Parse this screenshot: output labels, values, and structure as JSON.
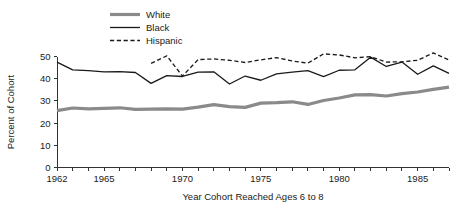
{
  "chart_data": {
    "type": "line",
    "title": "",
    "xlabel": "Year Cohort Reached Ages 6 to 8",
    "ylabel": "Percent of Cohort",
    "xlim": [
      1962,
      1987
    ],
    "ylim": [
      0,
      50
    ],
    "grid": false,
    "legend_position": "top-left",
    "x_tick_labels": [
      "1962",
      "1965",
      "1970",
      "1975",
      "1980",
      "1985"
    ],
    "x_tick_values": [
      1962,
      1965,
      1970,
      1975,
      1980,
      1985
    ],
    "x_minor_ticks": [
      1962,
      1963,
      1964,
      1965,
      1966,
      1967,
      1968,
      1969,
      1970,
      1971,
      1972,
      1973,
      1974,
      1975,
      1976,
      1977,
      1978,
      1979,
      1980,
      1981,
      1982,
      1983,
      1984,
      1985,
      1986,
      1987
    ],
    "y_tick_labels": [
      "0",
      "10",
      "20",
      "30",
      "40",
      "50"
    ],
    "y_tick_values": [
      0,
      10,
      20,
      30,
      40,
      50
    ],
    "x": [
      1962,
      1963,
      1964,
      1965,
      1966,
      1967,
      1968,
      1969,
      1970,
      1971,
      1972,
      1973,
      1974,
      1975,
      1976,
      1977,
      1978,
      1979,
      1980,
      1981,
      1982,
      1983,
      1984,
      1985,
      1986,
      1987
    ],
    "series": [
      {
        "name": "White",
        "style": "solid-thick",
        "color": "#8a8a8a",
        "width": 3.2,
        "x": [
          1962,
          1963,
          1964,
          1965,
          1966,
          1967,
          1968,
          1969,
          1970,
          1971,
          1972,
          1973,
          1974,
          1975,
          1976,
          1977,
          1978,
          1979,
          1980,
          1981,
          1982,
          1983,
          1984,
          1985,
          1986,
          1987
        ],
        "values": [
          25.6,
          26.8,
          26.4,
          26.6,
          26.9,
          26.2,
          26.3,
          26.4,
          26.3,
          27.2,
          28.3,
          27.4,
          27.1,
          29.0,
          29.2,
          29.6,
          28.4,
          30.2,
          31.3,
          32.7,
          32.8,
          32.2,
          33.3,
          34.0,
          35.2,
          36.2
        ]
      },
      {
        "name": "Black",
        "style": "solid-thin",
        "color": "#1a1a1a",
        "width": 1.3,
        "x": [
          1962,
          1963,
          1964,
          1965,
          1966,
          1967,
          1968,
          1969,
          1970,
          1971,
          1972,
          1973,
          1974,
          1975,
          1976,
          1977,
          1978,
          1979,
          1980,
          1981,
          1982,
          1983,
          1984,
          1985,
          1986,
          1987
        ],
        "values": [
          47.5,
          44.0,
          43.6,
          43.1,
          43.2,
          42.8,
          37.9,
          41.4,
          41.0,
          43.0,
          43.1,
          37.6,
          41.2,
          39.3,
          42.2,
          43.0,
          43.6,
          40.9,
          43.8,
          44.0,
          49.7,
          45.5,
          47.5,
          42.0,
          45.8,
          42.4
        ]
      },
      {
        "name": "Hispanic",
        "style": "dashed",
        "color": "#1a1a1a",
        "width": 1.3,
        "x": [
          1968,
          1969,
          1970,
          1971,
          1972,
          1973,
          1974,
          1975,
          1976,
          1977,
          1978,
          1979,
          1980,
          1981,
          1982,
          1983,
          1984,
          1985,
          1986,
          1987
        ],
        "values": [
          46.9,
          50.3,
          41.2,
          48.6,
          48.9,
          48.3,
          47.3,
          48.5,
          49.5,
          48.0,
          47.0,
          51.2,
          50.7,
          49.4,
          49.9,
          47.5,
          47.6,
          48.3,
          51.6,
          48.4
        ]
      }
    ]
  },
  "legend": {
    "items": [
      {
        "label": "White"
      },
      {
        "label": "Black"
      },
      {
        "label": "Hispanic"
      }
    ]
  }
}
